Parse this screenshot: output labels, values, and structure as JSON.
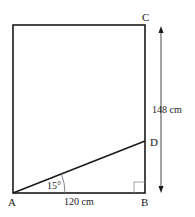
{
  "diagram": {
    "points": {
      "A": {
        "label": "A"
      },
      "B": {
        "label": "B"
      },
      "C": {
        "label": "C"
      },
      "D": {
        "label": "D"
      }
    },
    "angle_label": "15°",
    "base_label": "120 cm",
    "height_label": "148 cm",
    "stroke_color": "#1a1a1a",
    "right_angle_color": "#888888"
  }
}
